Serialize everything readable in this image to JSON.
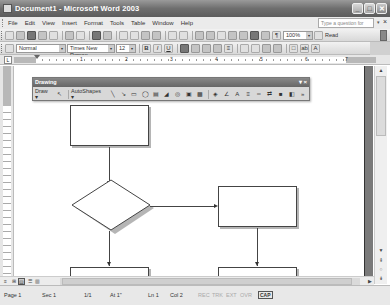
{
  "window": {
    "title": "Document1 - Microsoft Word 2003",
    "controls": {
      "minimize": "_",
      "maximize": "□",
      "close": "✕"
    }
  },
  "menubar": {
    "items": [
      "File",
      "Edit",
      "View",
      "Insert",
      "Format",
      "Tools",
      "Table",
      "Window",
      "Help"
    ],
    "help_placeholder": "Type a question for help",
    "help_dropdown": "▾",
    "doc_close": "×"
  },
  "standard_toolbar": {
    "zoom": "100%",
    "read_label": "Read",
    "buttons": [
      "new",
      "open",
      "save",
      "permission",
      "email",
      "print",
      "print-preview",
      "spelling",
      "research",
      "cut",
      "copy",
      "paste",
      "format-painter",
      "undo",
      "redo",
      "hyperlink",
      "tables-borders",
      "insert-table",
      "insert-excel",
      "columns",
      "drawing",
      "document-map",
      "show-hide"
    ]
  },
  "formatting_toolbar": {
    "style": "Normal",
    "font": "Times New Roman",
    "size": "12",
    "bold": "B",
    "italic": "I",
    "underline": "U",
    "align": [
      "align-left",
      "center",
      "align-right",
      "justify"
    ],
    "line_spacing": "≡",
    "numbering": "numbering",
    "bullets": "bullets",
    "decrease_indent": "decrease-indent",
    "increase_indent": "increase-indent",
    "borders": "□",
    "highlight": "ab",
    "font_color": "A"
  },
  "ruler": {
    "numbers": [
      "1",
      "2",
      "3",
      "4",
      "5",
      "6",
      "7"
    ]
  },
  "drawing_toolbar": {
    "title": "Drawing",
    "draw_label": "Draw ▾",
    "autoshapes_label": "AutoShapes ▾",
    "tools": [
      "select-objects",
      "line",
      "arrow",
      "rectangle",
      "oval",
      "text-box",
      "wordart",
      "diagram",
      "clip-art",
      "picture",
      "fill-color",
      "line-color",
      "font-color",
      "line-style",
      "dash-style",
      "arrow-style",
      "shadow-style",
      "3d-style"
    ],
    "controls": {
      "dropdown": "▾",
      "close": "×"
    }
  },
  "view_buttons": [
    "normal",
    "web-layout",
    "print-layout",
    "outline",
    "reading-layout"
  ],
  "statusbar": {
    "page": "Page  1",
    "sec": "Sec  1",
    "pages": "1/1",
    "at": "At  1\"",
    "ln": "Ln  1",
    "col": "Col  2",
    "rec": "REC",
    "trk": "TRK",
    "ext": "EXT",
    "ovr": "OVR",
    "language": "CAP"
  },
  "flowchart": {
    "shapes": [
      {
        "id": "box-top",
        "type": "rectangle"
      },
      {
        "id": "decision",
        "type": "diamond"
      },
      {
        "id": "box-right",
        "type": "rectangle"
      },
      {
        "id": "box-bottom-left",
        "type": "rectangle"
      },
      {
        "id": "box-bottom-right",
        "type": "rectangle"
      }
    ],
    "connectors": [
      {
        "from": "box-top",
        "to": "decision"
      },
      {
        "from": "decision",
        "to": "box-right"
      },
      {
        "from": "decision",
        "to": "box-bottom-left"
      },
      {
        "from": "box-right",
        "to": "box-bottom-right"
      }
    ]
  }
}
